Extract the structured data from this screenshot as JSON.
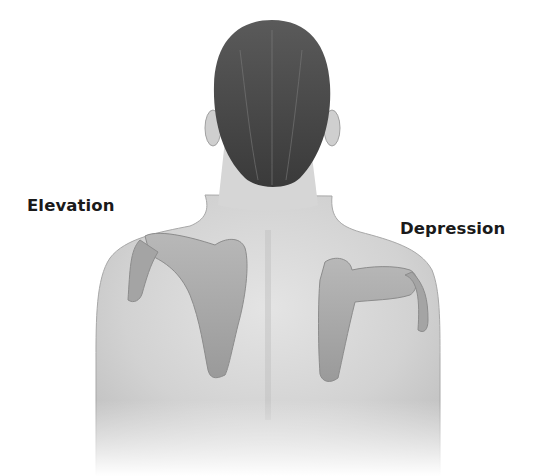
{
  "diagram": {
    "labels": {
      "left": "Elevation",
      "right": "Depression"
    },
    "colors": {
      "background": "#ffffff",
      "skin": "#d9d9d9",
      "skin_shadow": "#b8b8b8",
      "hair": "#4a4a4a",
      "scapula": "#a9a9a9",
      "label_text": "#1a1a1a"
    }
  }
}
